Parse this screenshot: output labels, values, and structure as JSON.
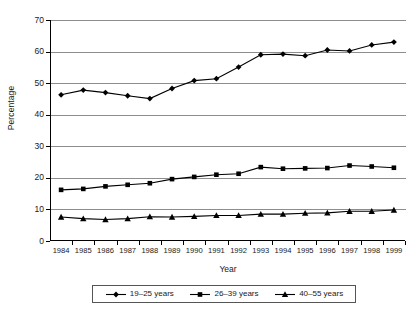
{
  "chart_data": {
    "type": "line",
    "title": "",
    "xlabel": "Year",
    "ylabel": "Percentage",
    "categories": [
      "1984",
      "1985",
      "1986",
      "1987",
      "1988",
      "1989",
      "1990",
      "1991",
      "1992",
      "1993",
      "1994",
      "1995",
      "1996",
      "1997",
      "1998",
      "1999"
    ],
    "ylim": [
      0,
      70
    ],
    "yticks": [
      "0",
      "10",
      "20",
      "30",
      "40",
      "50",
      "60",
      "70"
    ],
    "grid": "horizontal",
    "legend_position": "bottom",
    "series": [
      {
        "name": "19–25 years",
        "marker": "diamond",
        "color": "#000000",
        "values": [
          46.3,
          47.8,
          47.0,
          46.0,
          45.1,
          48.3,
          50.8,
          51.4,
          55.1,
          59.0,
          59.2,
          58.7,
          60.5,
          60.2,
          62.1,
          63.0
        ]
      },
      {
        "name": "26–39 years",
        "marker": "square",
        "color": "#000000",
        "values": [
          16.2,
          16.5,
          17.3,
          17.8,
          18.3,
          19.6,
          20.3,
          21.0,
          21.3,
          23.4,
          22.9,
          23.0,
          23.1,
          23.9,
          23.6,
          23.2
        ]
      },
      {
        "name": "40–55 years",
        "marker": "triangle",
        "color": "#000000",
        "values": [
          7.6,
          7.1,
          6.8,
          7.1,
          7.7,
          7.6,
          7.8,
          8.1,
          8.1,
          8.5,
          8.5,
          8.8,
          8.9,
          9.4,
          9.4,
          9.8
        ]
      }
    ]
  },
  "legend": {
    "entries": [
      {
        "label": "19–25 years",
        "marker": "diamond"
      },
      {
        "label": "26–39 years",
        "marker": "square"
      },
      {
        "label": "40–55 years",
        "marker": "triangle"
      }
    ]
  }
}
